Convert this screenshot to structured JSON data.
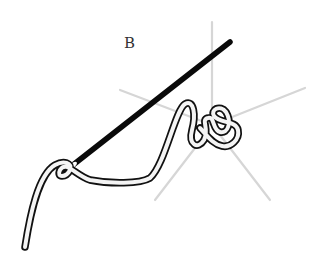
{
  "figure": {
    "label": "B",
    "colors": {
      "needle": "#0a0a0a",
      "thread_outline": "#111111",
      "thread_fill": "#f4f4f4",
      "rays": "#d6d6d6",
      "background": "#ffffff"
    },
    "ray_count": 5
  }
}
